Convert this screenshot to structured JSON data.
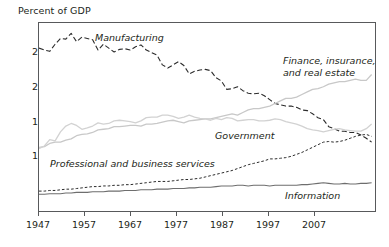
{
  "figure": {
    "axis_title": "Percent of GDP",
    "background": "#ffffff",
    "frame_color": "#58595b"
  },
  "labels": {
    "manufacturing": "Manufacturing",
    "finance_line1": "Finance, insurance,",
    "finance_line2": "and real estate",
    "government": "Government",
    "professional": "Professional and business services",
    "information": "Information"
  },
  "axes": {
    "y_ticks": [
      "25",
      "20",
      "15",
      "10",
      "5"
    ],
    "x_ticks": [
      "1947",
      "1957",
      "1967",
      "1977",
      "1987",
      "1997",
      "2007"
    ]
  },
  "chart_data": {
    "type": "line",
    "title": "",
    "xlabel": "",
    "ylabel": "Percent of GDP",
    "xlim": [
      1947,
      2010
    ],
    "ylim": [
      0,
      29.5
    ],
    "grid": false,
    "legend": "inline-annotations",
    "x_tick_values": [
      1947,
      1957,
      1967,
      1977,
      1987,
      1997,
      2007
    ],
    "y_tick_values": [
      5,
      10,
      15,
      20,
      25
    ],
    "series": [
      {
        "name": "Manufacturing",
        "color": "#2b2b2b",
        "style": "dashed",
        "width": 1.1,
        "x": [
          1947,
          1948,
          1949,
          1950,
          1951,
          1952,
          1953,
          1954,
          1955,
          1956,
          1957,
          1958,
          1959,
          1960,
          1961,
          1962,
          1963,
          1964,
          1965,
          1966,
          1967,
          1968,
          1969,
          1970,
          1971,
          1972,
          1973,
          1974,
          1975,
          1976,
          1977,
          1978,
          1979,
          1980,
          1981,
          1982,
          1983,
          1984,
          1985,
          1986,
          1987,
          1988,
          1989,
          1990,
          1991,
          1992,
          1993,
          1994,
          1995,
          1996,
          1997,
          1998,
          1999,
          2000,
          2001,
          2002,
          2003,
          2004,
          2005,
          2006,
          2007,
          2008,
          2009
        ],
        "values": [
          25.6,
          25.3,
          25.1,
          26.2,
          27.1,
          27.0,
          27.9,
          26.6,
          27.3,
          27.1,
          26.9,
          25.3,
          26.2,
          25.6,
          25.0,
          25.4,
          25.5,
          25.3,
          25.8,
          26.1,
          25.3,
          24.9,
          24.5,
          23.0,
          22.5,
          23.0,
          23.5,
          22.9,
          21.6,
          22.0,
          22.2,
          22.3,
          22.1,
          21.0,
          20.5,
          19.2,
          19.3,
          19.6,
          19.0,
          18.6,
          18.5,
          18.6,
          18.2,
          17.6,
          17.0,
          16.8,
          16.6,
          16.6,
          16.4,
          16.0,
          15.9,
          15.4,
          14.8,
          14.5,
          13.4,
          13.1,
          12.7,
          12.7,
          12.5,
          12.5,
          12.1,
          11.6,
          11.0
        ]
      },
      {
        "name": "Finance, insurance, and real estate",
        "color": "#c8c8c8",
        "style": "solid",
        "width": 1.3,
        "x": [
          1947,
          1948,
          1949,
          1950,
          1951,
          1952,
          1953,
          1954,
          1955,
          1956,
          1957,
          1958,
          1959,
          1960,
          1961,
          1962,
          1963,
          1964,
          1965,
          1966,
          1967,
          1968,
          1969,
          1970,
          1971,
          1972,
          1973,
          1974,
          1975,
          1976,
          1977,
          1978,
          1979,
          1980,
          1981,
          1982,
          1983,
          1984,
          1985,
          1986,
          1987,
          1988,
          1989,
          1990,
          1991,
          1992,
          1993,
          1994,
          1995,
          1996,
          1997,
          1998,
          1999,
          2000,
          2001,
          2002,
          2003,
          2004,
          2005,
          2006,
          2007,
          2008,
          2009
        ],
        "values": [
          10.2,
          10.3,
          10.8,
          11.0,
          11.0,
          11.3,
          11.5,
          12.0,
          12.2,
          12.3,
          12.5,
          12.9,
          13.0,
          13.1,
          13.4,
          13.4,
          13.5,
          13.6,
          13.6,
          13.5,
          13.8,
          13.8,
          13.9,
          14.1,
          14.3,
          14.4,
          14.2,
          14.0,
          14.3,
          14.4,
          14.5,
          14.6,
          14.6,
          14.8,
          15.0,
          15.2,
          15.4,
          15.2,
          15.6,
          16.0,
          16.2,
          16.2,
          16.4,
          16.6,
          17.0,
          17.4,
          17.8,
          17.8,
          18.0,
          18.4,
          18.8,
          19.2,
          19.3,
          19.6,
          20.0,
          20.2,
          20.4,
          20.4,
          20.6,
          20.8,
          20.6,
          20.6,
          21.5
        ]
      },
      {
        "name": "Government",
        "color": "#d2d2d2",
        "style": "solid",
        "width": 1.3,
        "x": [
          1947,
          1948,
          1949,
          1950,
          1951,
          1952,
          1953,
          1954,
          1955,
          1956,
          1957,
          1958,
          1959,
          1960,
          1961,
          1962,
          1963,
          1964,
          1965,
          1966,
          1967,
          1968,
          1969,
          1970,
          1971,
          1972,
          1973,
          1974,
          1975,
          1976,
          1977,
          1978,
          1979,
          1980,
          1981,
          1982,
          1983,
          1984,
          1985,
          1986,
          1987,
          1988,
          1989,
          1990,
          1991,
          1992,
          1993,
          1994,
          1995,
          1996,
          1997,
          1998,
          1999,
          2000,
          2001,
          2002,
          2003,
          2004,
          2005,
          2006,
          2007,
          2008,
          2009
        ],
        "values": [
          10.0,
          10.4,
          11.4,
          11.2,
          12.6,
          13.5,
          13.9,
          13.6,
          13.0,
          13.2,
          13.5,
          14.0,
          13.8,
          13.9,
          14.3,
          14.4,
          14.3,
          14.2,
          14.0,
          14.3,
          14.8,
          14.9,
          14.9,
          15.2,
          15.2,
          15.0,
          14.7,
          14.9,
          15.2,
          14.9,
          14.7,
          14.6,
          14.4,
          14.7,
          14.5,
          14.8,
          14.7,
          14.3,
          14.4,
          14.5,
          14.5,
          14.3,
          14.3,
          14.4,
          14.6,
          14.5,
          14.2,
          14.0,
          13.8,
          13.5,
          13.1,
          12.9,
          12.8,
          12.6,
          12.8,
          13.0,
          13.1,
          12.9,
          12.8,
          12.7,
          12.7,
          13.1,
          13.8
        ]
      },
      {
        "name": "Professional and business services",
        "color": "#2b2b2b",
        "style": "fine-dashed",
        "width": 1.0,
        "x": [
          1947,
          1948,
          1949,
          1950,
          1951,
          1952,
          1953,
          1954,
          1955,
          1956,
          1957,
          1958,
          1959,
          1960,
          1961,
          1962,
          1963,
          1964,
          1965,
          1966,
          1967,
          1968,
          1969,
          1970,
          1971,
          1972,
          1973,
          1974,
          1975,
          1976,
          1977,
          1978,
          1979,
          1980,
          1981,
          1982,
          1983,
          1984,
          1985,
          1986,
          1987,
          1988,
          1989,
          1990,
          1991,
          1992,
          1993,
          1994,
          1995,
          1996,
          1997,
          1998,
          1999,
          2000,
          2001,
          2002,
          2003,
          2004,
          2005,
          2006,
          2007,
          2008,
          2009
        ],
        "values": [
          3.4,
          3.4,
          3.5,
          3.5,
          3.6,
          3.7,
          3.7,
          3.8,
          3.9,
          4.0,
          4.1,
          4.1,
          4.2,
          4.2,
          4.3,
          4.3,
          4.4,
          4.4,
          4.5,
          4.6,
          4.7,
          4.8,
          4.9,
          4.9,
          4.9,
          5.0,
          5.1,
          5.2,
          5.2,
          5.3,
          5.4,
          5.6,
          5.8,
          6.0,
          6.2,
          6.4,
          6.6,
          6.9,
          7.2,
          7.5,
          7.7,
          7.9,
          8.1,
          8.4,
          8.4,
          8.5,
          8.6,
          8.8,
          9.1,
          9.4,
          9.8,
          10.2,
          10.6,
          11.0,
          11.1,
          11.0,
          11.1,
          11.3,
          11.6,
          11.9,
          12.1,
          12.2,
          11.9
        ]
      },
      {
        "name": "Information",
        "color": "#6e6e6e",
        "style": "solid",
        "width": 1.1,
        "x": [
          1947,
          1948,
          1949,
          1950,
          1951,
          1952,
          1953,
          1954,
          1955,
          1956,
          1957,
          1958,
          1959,
          1960,
          1961,
          1962,
          1963,
          1964,
          1965,
          1966,
          1967,
          1968,
          1969,
          1970,
          1971,
          1972,
          1973,
          1974,
          1975,
          1976,
          1977,
          1978,
          1979,
          1980,
          1981,
          1982,
          1983,
          1984,
          1985,
          1986,
          1987,
          1988,
          1989,
          1990,
          1991,
          1992,
          1993,
          1994,
          1995,
          1996,
          1997,
          1998,
          1999,
          2000,
          2001,
          2002,
          2003,
          2004,
          2005,
          2006,
          2007,
          2008,
          2009
        ],
        "values": [
          2.9,
          2.9,
          3.0,
          3.0,
          3.0,
          3.1,
          3.1,
          3.2,
          3.2,
          3.2,
          3.3,
          3.3,
          3.3,
          3.4,
          3.4,
          3.4,
          3.5,
          3.5,
          3.5,
          3.6,
          3.6,
          3.6,
          3.7,
          3.7,
          3.7,
          3.8,
          3.8,
          3.8,
          3.9,
          3.9,
          4.0,
          4.0,
          4.0,
          4.1,
          4.2,
          4.2,
          4.2,
          4.3,
          4.3,
          4.2,
          4.3,
          4.3,
          4.3,
          4.2,
          4.3,
          4.3,
          4.3,
          4.3,
          4.3,
          4.4,
          4.4,
          4.5,
          4.6,
          4.7,
          4.6,
          4.5,
          4.5,
          4.6,
          4.5,
          4.5,
          4.6,
          4.6,
          4.7
        ]
      }
    ]
  }
}
